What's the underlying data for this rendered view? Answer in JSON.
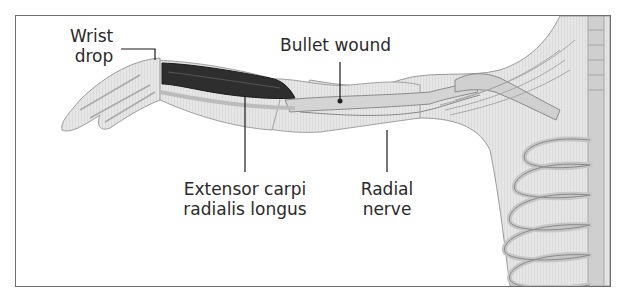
{
  "figure": {
    "type": "anatomical-illustration",
    "labels": {
      "wrist_drop": [
        "Wrist",
        "drop"
      ],
      "bullet_wound": "Bullet wound",
      "extensor": [
        "Extensor carpi",
        "radialis longus"
      ],
      "radial_nerve": [
        "Radial",
        "nerve"
      ]
    },
    "colors": {
      "frame_border": "#6f6f6f",
      "skin_fill": "#e3e3e3",
      "muscle_fill": "#2e2e2e",
      "bone_fill": "#d2d2d2",
      "leader_line": "#1a1a1a",
      "label_text": "#2a2a2a"
    }
  }
}
